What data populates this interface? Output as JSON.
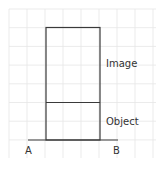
{
  "diagram": {
    "labels": {
      "image": "Image",
      "object": "Object",
      "point_a": "A",
      "point_b": "B"
    },
    "colors": {
      "grid": "#e6e6e6",
      "lines": "#3a3a3a",
      "text": "#333333"
    }
  }
}
